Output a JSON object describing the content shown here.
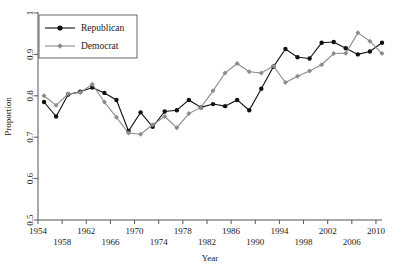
{
  "chart_data": {
    "type": "line",
    "title": "",
    "xlabel": "Year",
    "ylabel": "Proportion",
    "xlim": [
      1954,
      2011
    ],
    "ylim": [
      0.5,
      1.0
    ],
    "yticks": [
      0.5,
      0.6,
      0.7,
      0.8,
      0.9,
      1
    ],
    "ytick_labels": [
      "0.5",
      "0.6",
      "0.7",
      "0.8",
      "0.9",
      "1"
    ],
    "xticks": [
      1954,
      1958,
      1962,
      1966,
      1970,
      1974,
      1978,
      1982,
      1986,
      1990,
      1994,
      1998,
      2002,
      2006,
      2010
    ],
    "xtick_labels": [
      "1954",
      "1958",
      "1962",
      "1966",
      "1970",
      "1974",
      "1978",
      "1982",
      "1986",
      "1990",
      "1994",
      "1998",
      "2002",
      "2006",
      "2010"
    ],
    "grid": false,
    "legend_position": "top-left",
    "x": [
      1955,
      1957,
      1959,
      1961,
      1963,
      1965,
      1967,
      1969,
      1971,
      1973,
      1975,
      1977,
      1979,
      1981,
      1983,
      1985,
      1987,
      1989,
      1991,
      1993,
      1995,
      1997,
      1999,
      2001,
      2003,
      2005,
      2007,
      2009,
      2011
    ],
    "series": [
      {
        "name": "Republican",
        "color": "#111111",
        "marker": "circle",
        "values": [
          0.785,
          0.75,
          0.803,
          0.81,
          0.82,
          0.807,
          0.79,
          0.715,
          0.76,
          0.725,
          0.762,
          0.765,
          0.79,
          0.772,
          0.78,
          0.775,
          0.79,
          0.765,
          0.817,
          0.87,
          0.913,
          0.893,
          0.89,
          0.928,
          0.93,
          0.915,
          0.9,
          0.907,
          0.928
        ]
      },
      {
        "name": "Democrat",
        "color": "#8c8c8c",
        "marker": "diamond",
        "values": [
          0.8,
          0.777,
          0.805,
          0.808,
          0.828,
          0.785,
          0.748,
          0.71,
          0.707,
          0.73,
          0.75,
          0.723,
          0.757,
          0.772,
          0.812,
          0.855,
          0.878,
          0.858,
          0.855,
          0.872,
          0.832,
          0.847,
          0.86,
          0.875,
          0.902,
          0.903,
          0.952,
          0.932,
          0.902
        ]
      }
    ]
  },
  "legend": {
    "entries": [
      {
        "label": "Republican"
      },
      {
        "label": "Democrat"
      }
    ]
  }
}
